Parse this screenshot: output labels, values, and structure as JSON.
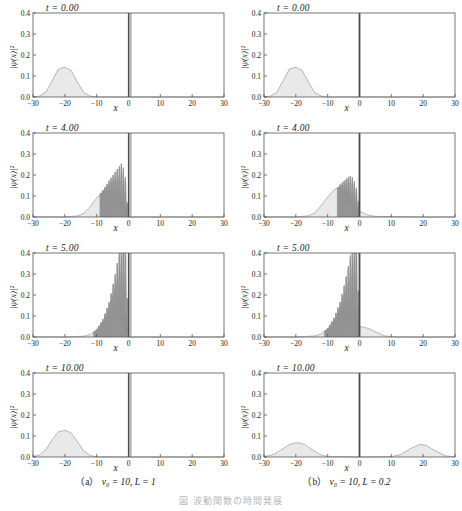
{
  "figure": {
    "xlabel": "x",
    "ylabel": "|ψ(x)|²",
    "bottom_caption": "図 波動関数の時間発展"
  },
  "axes": {
    "x_ticks": [
      "-30",
      "-20",
      "-10",
      "0",
      "10",
      "20",
      "30"
    ],
    "y_ticks": [
      "0.0",
      "0.1",
      "0.2",
      "0.3",
      "0.4"
    ],
    "xlim": [
      -30,
      30
    ],
    "ylim": [
      0,
      0.4
    ]
  },
  "captions": {
    "a": {
      "label": "（a）",
      "text": "v₀ = 10,  L = 1"
    },
    "b": {
      "label": "（b）",
      "text": "v₀ = 10,  L = 0.2"
    }
  },
  "colors": {
    "fill": "#e9e9e9",
    "curve": "#8c8c8c",
    "barrier_band": "#a9a9a9",
    "barrier_edge": "#4a4a4a",
    "axis": "#555555"
  },
  "chart_data": {
    "type": "line",
    "xlabel": "x",
    "ylabel": "|ψ(x)|²",
    "xlim": [
      -30,
      30
    ],
    "ylim": [
      0,
      0.4
    ],
    "grid": false,
    "legend": "none",
    "panels": [
      {
        "column": "a",
        "potential": {
          "v0": 10,
          "L": 1,
          "x_left": 0,
          "x_right": 1
        },
        "time_label": "t = 0.00",
        "t": 0.0,
        "description": "Gaussian packet centered at x = -20, peak |psi|^2 = 0.142, width ~ 4",
        "peaks": [
          {
            "x": -20,
            "y": 0.142
          }
        ],
        "x": [
          -30,
          -28,
          -26,
          -24,
          -22,
          -20,
          -18,
          -16,
          -14,
          -12,
          -10,
          0,
          10,
          20,
          30
        ],
        "y": [
          0.0,
          0.004,
          0.022,
          0.077,
          0.133,
          0.142,
          0.126,
          0.07,
          0.02,
          0.004,
          0.0,
          0.0,
          0.0,
          0.0,
          0.0
        ]
      },
      {
        "column": "a",
        "potential": {
          "v0": 10,
          "L": 1,
          "x_left": 0,
          "x_right": 1
        },
        "time_label": "t = 4.00",
        "t": 4.0,
        "description": "Packet has reached the barrier; incident and reflected waves interfere producing fringes between x = -8 and x = 0, envelope peak 0.21 near x = -2",
        "envelope_peak": {
          "x": -2,
          "y": 0.21
        },
        "fringe_region": [
          -9,
          0
        ],
        "x": [
          -30,
          -20,
          -16,
          -14,
          -12,
          -10,
          -8,
          -6,
          -4,
          -2,
          -1,
          0,
          5,
          20,
          30
        ],
        "y": [
          0.0,
          0.0,
          0.005,
          0.018,
          0.05,
          0.09,
          0.125,
          0.16,
          0.185,
          0.205,
          0.15,
          0.0,
          0.0,
          0.0,
          0.0
        ]
      },
      {
        "column": "a",
        "potential": {
          "v0": 10,
          "L": 1,
          "x_left": 0,
          "x_right": 1
        },
        "time_label": "t = 5.00",
        "t": 5.0,
        "description": "Strong standing wave at the barrier; fringes clipped at the top of the axis (>= 0.4) for x between -4 and 0",
        "envelope_peak": {
          "x": -1,
          "y": 0.4
        },
        "fringe_region": [
          -11,
          0
        ],
        "x": [
          -30,
          -20,
          -14,
          -12,
          -10,
          -8,
          -6,
          -4,
          -2,
          -1,
          0,
          10,
          20,
          30
        ],
        "y": [
          0.0,
          0.0,
          0.004,
          0.012,
          0.035,
          0.08,
          0.15,
          0.26,
          0.38,
          0.4,
          0.0,
          0.0,
          0.0,
          0.0
        ]
      },
      {
        "column": "a",
        "potential": {
          "v0": 10,
          "L": 1,
          "x_left": 0,
          "x_right": 1
        },
        "time_label": "t = 10.00",
        "t": 10.0,
        "description": "Packet has fully reflected; single broadened Gaussian back at x = -20, peak 0.127, no transmitted component",
        "peaks": [
          {
            "x": -20,
            "y": 0.127
          }
        ],
        "x": [
          -30,
          -28,
          -26,
          -24,
          -22,
          -20,
          -18,
          -16,
          -14,
          -12,
          -10,
          0,
          10,
          20,
          30
        ],
        "y": [
          0.002,
          0.01,
          0.034,
          0.082,
          0.12,
          0.127,
          0.115,
          0.072,
          0.028,
          0.007,
          0.001,
          0.0,
          0.0,
          0.0,
          0.0
        ]
      },
      {
        "column": "b",
        "potential": {
          "v0": 10,
          "L": 0.2,
          "x_left": 0,
          "x_right": 0.2
        },
        "time_label": "t = 0.00",
        "t": 0.0,
        "description": "Gaussian packet centered at x = -20, peak |psi|^2 = 0.142",
        "peaks": [
          {
            "x": -20,
            "y": 0.142
          }
        ],
        "x": [
          -30,
          -28,
          -26,
          -24,
          -22,
          -20,
          -18,
          -16,
          -14,
          -12,
          -10,
          0,
          10,
          20,
          30
        ],
        "y": [
          0.0,
          0.004,
          0.022,
          0.077,
          0.133,
          0.142,
          0.126,
          0.07,
          0.02,
          0.004,
          0.0,
          0.0,
          0.0,
          0.0,
          0.0
        ]
      },
      {
        "column": "b",
        "potential": {
          "v0": 10,
          "L": 0.2,
          "x_left": 0,
          "x_right": 0.2
        },
        "time_label": "t = 4.00",
        "t": 4.0,
        "description": "Packet at the thin barrier with weaker interference fringes, envelope peak 0.165 near x = -3; small transmitted tail beyond x = 0",
        "envelope_peak": {
          "x": -3,
          "y": 0.165
        },
        "fringe_region": [
          -7,
          0
        ],
        "x": [
          -30,
          -20,
          -16,
          -14,
          -12,
          -10,
          -8,
          -6,
          -4,
          -3,
          -2,
          -1,
          0,
          2,
          5,
          20,
          30
        ],
        "y": [
          0.0,
          0.0,
          0.006,
          0.02,
          0.055,
          0.095,
          0.128,
          0.15,
          0.162,
          0.165,
          0.15,
          0.11,
          0.03,
          0.012,
          0.003,
          0.0,
          0.0
        ]
      },
      {
        "column": "b",
        "potential": {
          "v0": 10,
          "L": 0.2,
          "x_left": 0,
          "x_right": 0.2
        },
        "time_label": "t = 5.00",
        "t": 5.0,
        "description": "Tall narrow interference spike reaching 0.4 at the barrier, plus a transmitted lobe of height 0.05 extending to x = 8",
        "envelope_peak": {
          "x": -0.5,
          "y": 0.4
        },
        "fringe_region": [
          -11,
          0
        ],
        "transmitted_lobe": {
          "x_range": [
            0,
            9
          ],
          "peak_y": 0.05
        },
        "x": [
          -30,
          -20,
          -14,
          -12,
          -10,
          -8,
          -6,
          -4,
          -2,
          -1,
          0,
          1,
          3,
          5,
          8,
          12,
          20,
          30
        ],
        "y": [
          0.0,
          0.0,
          0.005,
          0.015,
          0.04,
          0.085,
          0.15,
          0.25,
          0.36,
          0.4,
          0.05,
          0.048,
          0.04,
          0.025,
          0.005,
          0.0,
          0.0,
          0.0
        ]
      },
      {
        "column": "b",
        "potential": {
          "v0": 10,
          "L": 0.2,
          "x_left": 0,
          "x_right": 0.2
        },
        "time_label": "t = 10.00",
        "t": 10.0,
        "description": "Packet split into a reflected lobe at x = -19 (peak 0.068) and a transmitted lobe at x = 19 (peak 0.060)",
        "peaks": [
          {
            "x": -19,
            "y": 0.068
          },
          {
            "x": 19,
            "y": 0.06
          }
        ],
        "x": [
          -30,
          -27,
          -24,
          -22,
          -20,
          -19,
          -17,
          -15,
          -12,
          -10,
          0,
          10,
          13,
          16,
          19,
          21,
          24,
          27,
          30
        ],
        "y": [
          0.002,
          0.012,
          0.04,
          0.06,
          0.067,
          0.068,
          0.058,
          0.036,
          0.01,
          0.003,
          0.0,
          0.002,
          0.012,
          0.04,
          0.06,
          0.055,
          0.028,
          0.006,
          0.0
        ]
      }
    ]
  }
}
